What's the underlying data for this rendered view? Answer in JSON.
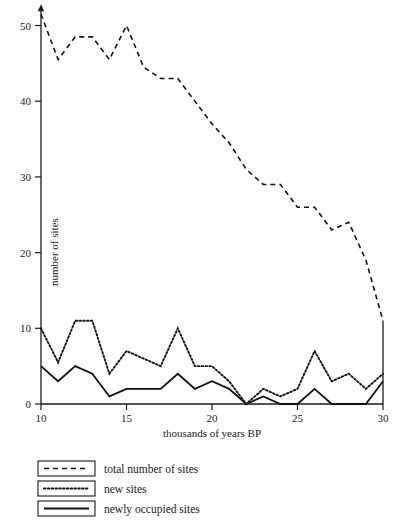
{
  "chart_data": {
    "type": "line",
    "title": "",
    "xlabel": "thousands of years BP",
    "ylabel": "number of sites",
    "xlim": [
      10,
      30
    ],
    "ylim": [
      0,
      52
    ],
    "xticks": [
      10,
      15,
      20,
      25,
      30
    ],
    "yticks": [
      0,
      10,
      20,
      30,
      40,
      50
    ],
    "grid": false,
    "legend_position": "below-plot",
    "x": [
      10,
      11,
      12,
      13,
      14,
      15,
      16,
      17,
      18,
      19,
      20,
      21,
      22,
      23,
      24,
      25,
      26,
      27,
      28,
      29,
      30
    ],
    "series": [
      {
        "name": "total number of sites",
        "style": "dashed",
        "values": [
          51.5,
          45.5,
          48.5,
          48.5,
          45.5,
          50,
          44.5,
          43,
          43,
          40,
          37,
          34.5,
          31,
          29,
          29,
          26,
          26,
          23,
          24,
          19,
          11
        ]
      },
      {
        "name": "new sites",
        "style": "dotted",
        "values": [
          10,
          5.5,
          11,
          11,
          4,
          7,
          6,
          5,
          10,
          5,
          5,
          3,
          0,
          2,
          1,
          2,
          7,
          3,
          4,
          2,
          4
        ]
      },
      {
        "name": "newly occupied sites",
        "style": "solid",
        "values": [
          5,
          3,
          5,
          4,
          1,
          2,
          2,
          2,
          4,
          2,
          3,
          2,
          0,
          1,
          0,
          0,
          2,
          0,
          0,
          0,
          3
        ]
      }
    ]
  },
  "legend": {
    "items": [
      {
        "label": "total number of sites",
        "style": "dashed"
      },
      {
        "label": "new sites",
        "style": "dotted"
      },
      {
        "label": "newly occupied sites",
        "style": "solid"
      }
    ]
  },
  "colors": {
    "ink": "#111111",
    "background": "#ffffff"
  }
}
